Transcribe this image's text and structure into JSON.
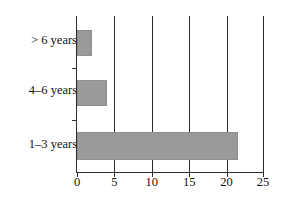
{
  "chart_data": {
    "type": "bar",
    "orientation": "horizontal",
    "title": "",
    "xlabel": "",
    "ylabel": "",
    "categories": [
      "1–3 years",
      "4–6 years",
      "> 6 years"
    ],
    "values": [
      21.5,
      4,
      2
    ],
    "xlim": [
      0,
      25
    ],
    "xticks": [
      0,
      5,
      10,
      15,
      20,
      25
    ],
    "xtick_labels": [
      "0",
      "5",
      "10",
      "15",
      "20",
      "25"
    ],
    "grid": "vertical",
    "legend": "none",
    "bar_color": "#9a9a9a",
    "axis_color": "#2b2b2b",
    "background": "#ffffff"
  },
  "axis": {
    "ticks": [
      {
        "label": "0",
        "value": 0
      },
      {
        "label": "5",
        "value": 5
      },
      {
        "label": "10",
        "value": 10
      },
      {
        "label": "15",
        "value": 15
      },
      {
        "label": "20",
        "value": 20
      },
      {
        "label": "25",
        "value": 25
      }
    ]
  },
  "bars": [
    {
      "label": "> 6 years",
      "value": 2
    },
    {
      "label": "4–6 years",
      "value": 4
    },
    {
      "label": "1–3 years",
      "value": 21.5
    }
  ]
}
